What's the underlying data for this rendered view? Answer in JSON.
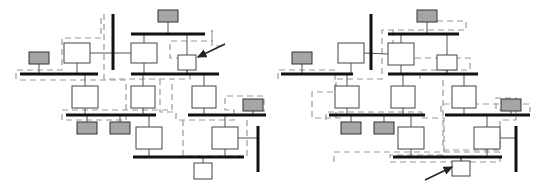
{
  "figure": {
    "type": "single-line-diagram-pair",
    "title": "",
    "background": "#ffffff",
    "width": 552,
    "height": 188
  },
  "style": {
    "busbar_color": "#111111",
    "busbar_thickness": 3,
    "vertical_busbar_thickness": 3,
    "branch_color": "#555555",
    "branch_thickness": 1,
    "node_fill": "#ffffff",
    "node_stroke": "#444444",
    "load_fill": "#a5a5a5",
    "load_stroke": "#333333",
    "partition_color": "#9a9a9a",
    "partition_dash": "6 4",
    "partition_thickness": 1.2,
    "arrow_color": "#222222"
  },
  "legend_semantics": {
    "white_box": "transformer / branch element",
    "gray_box": "load or generator unit",
    "thick_black_line": "busbar",
    "dashed_gray_outline": "network partition boundary",
    "arrow": "callout annotation pointing at highlighted element"
  },
  "diagrams": [
    {
      "id": "left",
      "name": "left-network-diagram",
      "label": "",
      "busbars_horizontal": [
        {
          "name": "bus-top",
          "x1": 131,
          "x2": 205,
          "y": 34
        },
        {
          "name": "bus-main-left",
          "x1": 20,
          "x2": 98,
          "y": 74
        },
        {
          "name": "bus-main-right",
          "x1": 131,
          "x2": 219,
          "y": 74
        },
        {
          "name": "bus-mid-left",
          "x1": 66,
          "x2": 156,
          "y": 115
        },
        {
          "name": "bus-mid-right",
          "x1": 188,
          "x2": 266,
          "y": 115
        },
        {
          "name": "bus-bottom",
          "x1": 133,
          "x2": 244,
          "y": 157
        }
      ],
      "busbars_vertical": [
        {
          "name": "vbus-upper",
          "x": 113,
          "y1": 14,
          "y2": 70
        },
        {
          "name": "vbus-lower-right",
          "x": 258,
          "y1": 126,
          "y2": 172
        }
      ],
      "nodes": [
        {
          "name": "node-a1",
          "x": 64,
          "y": 43,
          "w": 26,
          "h": 20,
          "kind": "white"
        },
        {
          "name": "node-a2",
          "x": 131,
          "y": 43,
          "w": 26,
          "h": 20,
          "kind": "white"
        },
        {
          "name": "node-highlighted",
          "x": 178,
          "y": 55,
          "w": 18,
          "h": 15,
          "kind": "white",
          "annotated": true
        },
        {
          "name": "node-b1",
          "x": 72,
          "y": 86,
          "w": 26,
          "h": 22,
          "kind": "white"
        },
        {
          "name": "node-b2",
          "x": 131,
          "y": 86,
          "w": 24,
          "h": 22,
          "kind": "white"
        },
        {
          "name": "node-b3",
          "x": 192,
          "y": 86,
          "w": 24,
          "h": 22,
          "kind": "white"
        },
        {
          "name": "node-c1",
          "x": 136,
          "y": 127,
          "w": 26,
          "h": 22,
          "kind": "white"
        },
        {
          "name": "node-c2",
          "x": 212,
          "y": 127,
          "w": 26,
          "h": 22,
          "kind": "white"
        },
        {
          "name": "node-d1",
          "x": 194,
          "y": 163,
          "w": 18,
          "h": 16,
          "kind": "white"
        }
      ],
      "loads": [
        {
          "name": "load-left-top",
          "x": 29,
          "y": 52,
          "w": 20,
          "h": 12
        },
        {
          "name": "load-top-center",
          "x": 158,
          "y": 10,
          "w": 20,
          "h": 12
        },
        {
          "name": "load-mid-a",
          "x": 77,
          "y": 122,
          "w": 20,
          "h": 12
        },
        {
          "name": "load-mid-b",
          "x": 110,
          "y": 122,
          "w": 20,
          "h": 12
        },
        {
          "name": "load-right",
          "x": 243,
          "y": 99,
          "w": 20,
          "h": 12
        }
      ],
      "arrow": {
        "name": "callout-arrow-left",
        "x1": 225,
        "y1": 44,
        "x2": 198,
        "y2": 57
      }
    },
    {
      "id": "right",
      "name": "right-network-diagram",
      "label": "",
      "busbars_horizontal": [
        {
          "name": "bus-top",
          "x1": 388,
          "x2": 459,
          "y": 34
        },
        {
          "name": "bus-main-left",
          "x1": 281,
          "x2": 353,
          "y": 74
        },
        {
          "name": "bus-main-right",
          "x1": 388,
          "x2": 478,
          "y": 74
        },
        {
          "name": "bus-mid-left",
          "x1": 329,
          "x2": 425,
          "y": 115
        },
        {
          "name": "bus-mid-right",
          "x1": 445,
          "x2": 530,
          "y": 115
        },
        {
          "name": "bus-bottom",
          "x1": 393,
          "x2": 502,
          "y": 157
        }
      ],
      "busbars_vertical": [
        {
          "name": "vbus-upper",
          "x": 371,
          "y1": 14,
          "y2": 70
        },
        {
          "name": "vbus-lower-right",
          "x": 516,
          "y1": 126,
          "y2": 172
        }
      ],
      "nodes": [
        {
          "name": "node-a1",
          "x": 338,
          "y": 43,
          "w": 26,
          "h": 20,
          "kind": "white"
        },
        {
          "name": "node-a2",
          "x": 388,
          "y": 43,
          "w": 26,
          "h": 22,
          "kind": "white"
        },
        {
          "name": "node-a3",
          "x": 437,
          "y": 55,
          "w": 20,
          "h": 15,
          "kind": "white"
        },
        {
          "name": "node-b1",
          "x": 335,
          "y": 86,
          "w": 24,
          "h": 22,
          "kind": "white"
        },
        {
          "name": "node-b2",
          "x": 391,
          "y": 86,
          "w": 24,
          "h": 22,
          "kind": "white"
        },
        {
          "name": "node-b3",
          "x": 452,
          "y": 86,
          "w": 24,
          "h": 22,
          "kind": "white"
        },
        {
          "name": "node-c1",
          "x": 398,
          "y": 127,
          "w": 26,
          "h": 22,
          "kind": "white"
        },
        {
          "name": "node-c2",
          "x": 474,
          "y": 127,
          "w": 26,
          "h": 22,
          "kind": "white"
        },
        {
          "name": "node-highlighted",
          "x": 452,
          "y": 161,
          "w": 18,
          "h": 15,
          "kind": "white",
          "annotated": true
        }
      ],
      "loads": [
        {
          "name": "load-left-top",
          "x": 292,
          "y": 52,
          "w": 20,
          "h": 12
        },
        {
          "name": "load-top-center",
          "x": 417,
          "y": 10,
          "w": 20,
          "h": 12
        },
        {
          "name": "load-mid-a",
          "x": 341,
          "y": 122,
          "w": 20,
          "h": 12
        },
        {
          "name": "load-mid-b",
          "x": 374,
          "y": 122,
          "w": 20,
          "h": 12
        },
        {
          "name": "load-right",
          "x": 501,
          "y": 99,
          "w": 20,
          "h": 12
        }
      ],
      "arrow": {
        "name": "callout-arrow-right",
        "x1": 425,
        "y1": 180,
        "x2": 452,
        "y2": 167
      }
    }
  ]
}
